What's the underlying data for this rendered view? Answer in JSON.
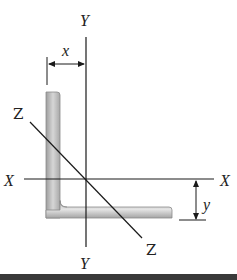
{
  "figure": {
    "type": "unequal-leg angle cross-section with principal axes",
    "axis_labels": {
      "y_top": "Y",
      "y_bottom": "Y",
      "x_left": "X",
      "x_right": "X",
      "z_top": "Z",
      "z_bottom": "Z"
    },
    "dimensions": {
      "x_label": "x",
      "y_label": "y"
    },
    "colors": {
      "line": "#1a1a1a",
      "section_fill": "#b8b8b8",
      "section_edge": "#8a8a8a",
      "section_highlight": "#e2e2e2",
      "bottom_bar": "#3a3a3a"
    }
  }
}
